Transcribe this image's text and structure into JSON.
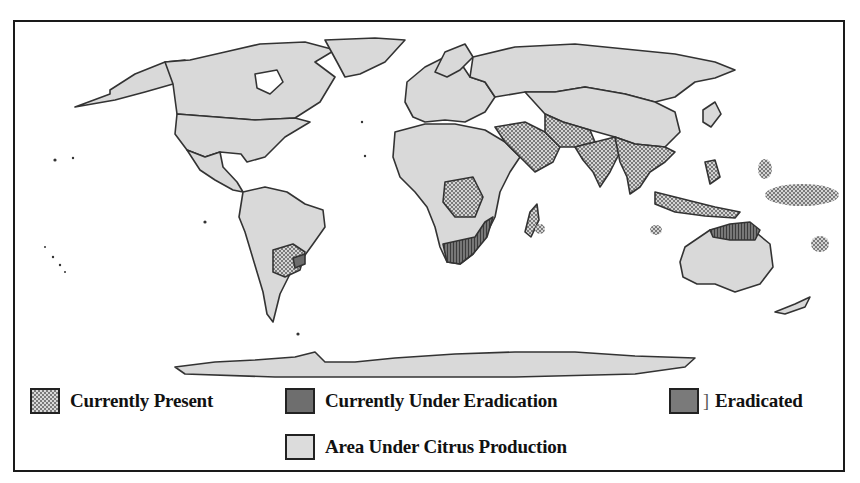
{
  "figure": {
    "type": "world-map"
  },
  "legend": {
    "items": [
      {
        "id": "present",
        "label": "Currently Present",
        "pattern": "crosshatch",
        "color": "#8a8a8a"
      },
      {
        "id": "under_eradication",
        "label": "Currently Under Eradication",
        "pattern": "solid-dark",
        "color": "#6e6e6e"
      },
      {
        "id": "eradicated",
        "label": "Eradicated",
        "pattern": "solid-dark",
        "color": "#7a7a7a",
        "suffix_mark": "]"
      },
      {
        "id": "citrus",
        "label": "Area Under Citrus Production",
        "pattern": "solid-light",
        "color": "#dcdcdc"
      }
    ]
  },
  "colors": {
    "land": "#d9d9d9",
    "border": "#333333",
    "present_hatch": "#7a7a7a",
    "under_eradication": "#6a6a6a",
    "frame": "#1a1a1a"
  },
  "regions": {
    "currently_present": [
      "Middle East / Arabian Peninsula",
      "Iran",
      "Pakistan",
      "India",
      "Southern China",
      "Southeast Asia (Myanmar, Thailand, Indochina)",
      "Central Africa (DR Congo)",
      "Madagascar",
      "Northern Argentina",
      "Paraguay",
      "Southern Brazil",
      "Pacific islands",
      "Indonesia / Papua New Guinea"
    ],
    "under_eradication": [
      "South Africa",
      "Mozambique coast",
      "Northern Australia"
    ],
    "eradicated": [
      "Uruguay / southern Brazil"
    ]
  }
}
